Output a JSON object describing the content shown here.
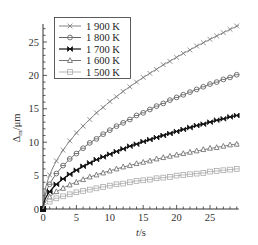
{
  "chart_data": {
    "type": "line",
    "title": "",
    "xlabel": "t/s",
    "xlabel_italic": "t",
    "xlabel_unit": "/s",
    "ylabel": "Δm/μm",
    "ylabel_main": "Δ",
    "ylabel_sub": "m",
    "ylabel_unit": "/μm",
    "xlim": [
      0,
      29.3
    ],
    "ylim": [
      0,
      27.7
    ],
    "xticks": [
      0,
      5,
      10,
      15,
      20,
      25
    ],
    "yticks": [
      0,
      5,
      10,
      15,
      20,
      25
    ],
    "grid": false,
    "legend_position": "upper left",
    "model": "k * sqrt(t)",
    "x": [
      0,
      1,
      2,
      3,
      4,
      5,
      6,
      7,
      8,
      9,
      10,
      11,
      12,
      13,
      14,
      15,
      16,
      17,
      18,
      19,
      20,
      21,
      22,
      23,
      24,
      25,
      26,
      27,
      28,
      29
    ],
    "series": [
      {
        "name": "1 900 K",
        "marker": "x",
        "color": "#777777",
        "k": 5.08,
        "values": [
          0,
          5.1,
          7.2,
          8.8,
          10.2,
          11.4,
          12.4,
          13.4,
          14.4,
          15.2,
          16.1,
          16.8,
          17.6,
          18.3,
          19.0,
          19.7,
          20.3,
          20.9,
          21.6,
          22.1,
          22.7,
          23.3,
          23.8,
          24.4,
          24.9,
          25.4,
          25.9,
          26.4,
          26.9,
          27.4
        ]
      },
      {
        "name": "1 800 K",
        "marker": "circle",
        "color": "#555555",
        "k": 3.73,
        "values": [
          0,
          3.7,
          5.3,
          6.5,
          7.5,
          8.3,
          9.1,
          9.9,
          10.5,
          11.2,
          11.8,
          12.4,
          12.9,
          13.4,
          14.0,
          14.4,
          14.9,
          15.4,
          15.8,
          16.3,
          16.7,
          17.1,
          17.5,
          17.9,
          18.3,
          18.7,
          19.0,
          19.4,
          19.7,
          20.1
        ]
      },
      {
        "name": "1 700 K",
        "marker": "bowtie",
        "color": "#111111",
        "k": 2.6,
        "values": [
          0,
          2.6,
          3.7,
          4.5,
          5.2,
          5.8,
          6.4,
          6.9,
          7.4,
          7.8,
          8.2,
          8.6,
          9.0,
          9.4,
          9.7,
          10.1,
          10.4,
          10.7,
          11.0,
          11.3,
          11.6,
          11.9,
          12.2,
          12.5,
          12.7,
          13.0,
          13.3,
          13.5,
          13.8,
          14.0
        ]
      },
      {
        "name": "1 600 K",
        "marker": "triangle",
        "color": "#666666",
        "k": 1.81,
        "values": [
          0,
          1.8,
          2.6,
          3.1,
          3.6,
          4.0,
          4.4,
          4.8,
          5.1,
          5.4,
          5.7,
          6.0,
          6.3,
          6.5,
          6.8,
          7.0,
          7.2,
          7.5,
          7.7,
          7.9,
          8.1,
          8.3,
          8.5,
          8.7,
          8.9,
          9.1,
          9.2,
          9.4,
          9.6,
          9.7
        ]
      },
      {
        "name": "1 500 K",
        "marker": "square",
        "color": "#aaaaaa",
        "k": 1.11,
        "values": [
          0,
          1.1,
          1.6,
          1.9,
          2.2,
          2.5,
          2.7,
          2.9,
          3.1,
          3.3,
          3.5,
          3.7,
          3.8,
          4.0,
          4.2,
          4.3,
          4.4,
          4.6,
          4.7,
          4.8,
          5.0,
          5.1,
          5.2,
          5.3,
          5.4,
          5.6,
          5.7,
          5.8,
          5.9,
          6.0
        ]
      }
    ]
  },
  "plot_area": {
    "x0": 43,
    "y0": 209,
    "px_per_x": 6.68,
    "px_per_y": 6.68
  }
}
